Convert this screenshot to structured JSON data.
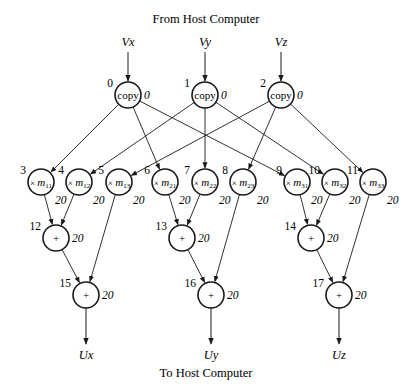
{
  "header": {
    "title": "From Host Computer"
  },
  "footer": {
    "title": "To Host Computer"
  },
  "inputs": [
    {
      "label": "Vx",
      "x": 128
    },
    {
      "label": "Vy",
      "x": 205
    },
    {
      "label": "Vz",
      "x": 281
    }
  ],
  "outputs": [
    {
      "label": "Ux",
      "x": 86
    },
    {
      "label": "Uy",
      "x": 211
    },
    {
      "label": "Uz",
      "x": 339
    }
  ],
  "nodes": [
    {
      "id": "0",
      "op": "copy",
      "weight": "0",
      "x": 128,
      "y": 95
    },
    {
      "id": "1",
      "op": "copy",
      "weight": "0",
      "x": 205,
      "y": 95
    },
    {
      "id": "2",
      "op": "copy",
      "weight": "0",
      "x": 281,
      "y": 95
    },
    {
      "id": "3",
      "op": "× m",
      "sub": "11",
      "weight": "20",
      "x": 41,
      "y": 182
    },
    {
      "id": "4",
      "op": "× m",
      "sub": "12",
      "weight": "20",
      "x": 79,
      "y": 182
    },
    {
      "id": "5",
      "op": "× m",
      "sub": "13",
      "weight": "20",
      "x": 119,
      "y": 182
    },
    {
      "id": "6",
      "op": "× m",
      "sub": "21",
      "weight": "20",
      "x": 165,
      "y": 182
    },
    {
      "id": "7",
      "op": "× m",
      "sub": "22",
      "weight": "20",
      "x": 205,
      "y": 182
    },
    {
      "id": "8",
      "op": "× m",
      "sub": "23",
      "weight": "20",
      "x": 243,
      "y": 182
    },
    {
      "id": "9",
      "op": "× m",
      "sub": "31",
      "weight": "20",
      "x": 297,
      "y": 182
    },
    {
      "id": "10",
      "op": "× m",
      "sub": "32",
      "weight": "20",
      "x": 335,
      "y": 182
    },
    {
      "id": "11",
      "op": "× m",
      "sub": "33",
      "weight": "20",
      "x": 373,
      "y": 182
    },
    {
      "id": "12",
      "op": "+",
      "weight": "20",
      "x": 56,
      "y": 238
    },
    {
      "id": "13",
      "op": "+",
      "weight": "20",
      "x": 182,
      "y": 238
    },
    {
      "id": "14",
      "op": "+",
      "weight": "20",
      "x": 311,
      "y": 238
    },
    {
      "id": "15",
      "op": "+",
      "weight": "20",
      "x": 86,
      "y": 295
    },
    {
      "id": "16",
      "op": "+",
      "weight": "20",
      "x": 211,
      "y": 295
    },
    {
      "id": "17",
      "op": "+",
      "weight": "20",
      "x": 339,
      "y": 295
    }
  ],
  "edges": [
    [
      "0",
      "3"
    ],
    [
      "0",
      "6"
    ],
    [
      "0",
      "9"
    ],
    [
      "1",
      "4"
    ],
    [
      "1",
      "7"
    ],
    [
      "1",
      "10"
    ],
    [
      "2",
      "5"
    ],
    [
      "2",
      "8"
    ],
    [
      "2",
      "11"
    ],
    [
      "3",
      "12"
    ],
    [
      "4",
      "12"
    ],
    [
      "5",
      "15"
    ],
    [
      "12",
      "15"
    ],
    [
      "6",
      "13"
    ],
    [
      "7",
      "13"
    ],
    [
      "8",
      "16"
    ],
    [
      "13",
      "16"
    ],
    [
      "9",
      "14"
    ],
    [
      "10",
      "14"
    ],
    [
      "11",
      "17"
    ],
    [
      "14",
      "17"
    ]
  ]
}
